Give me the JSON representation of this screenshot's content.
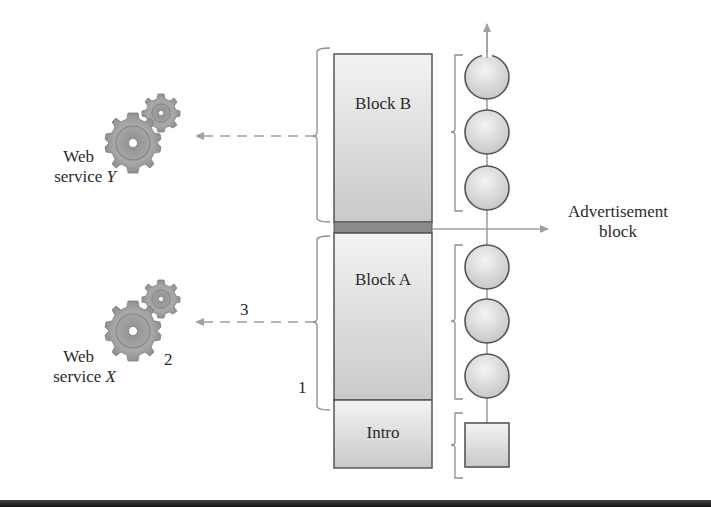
{
  "diagram": {
    "blocks": [
      {
        "id": "block-b",
        "label": "Block B"
      },
      {
        "id": "block-a",
        "label": "Block A"
      },
      {
        "id": "intro",
        "label": "Intro"
      }
    ],
    "services": [
      {
        "id": "service-y",
        "line1": "Web",
        "line2_prefix": "service ",
        "line2_var": "Y"
      },
      {
        "id": "service-x",
        "line1": "Web",
        "line2_prefix": "service ",
        "line2_var": "X"
      }
    ],
    "advertisement": {
      "line1": "Advertisement",
      "line2": "block"
    },
    "step_labels": {
      "one": "1",
      "two": "2",
      "three": "3"
    },
    "colors": {
      "block_fill_top": "#ececec",
      "block_fill_bottom": "#c8c8c8",
      "block_stroke": "#555555",
      "separator": "#8a8a8a",
      "arrow": "#a0a0a0",
      "bracket": "#8c8c8c",
      "gear": "#9a9a9a"
    }
  }
}
